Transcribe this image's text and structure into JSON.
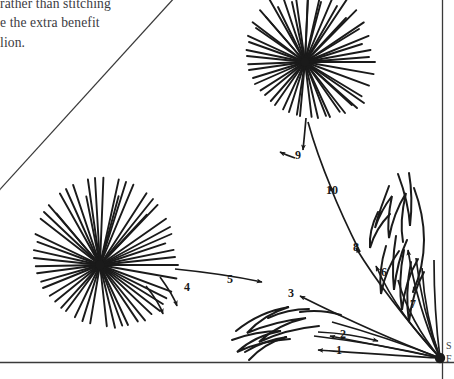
{
  "page": {
    "width": 454,
    "height": 379,
    "background_color": "#ffffff",
    "ink_color": "#1a1a1a",
    "text_color": "#3b3b3f",
    "rule_color": "#3a3a3a"
  },
  "body_text": {
    "line1": "rather than stitching",
    "line2": "e the extra benefit",
    "line3": "lion."
  },
  "edge_text": {
    "top_fragment": "S",
    "bottom_fragment": "F"
  },
  "rules": {
    "bottom_rule": "horizontal page rule",
    "right_rule": "vertical page rule",
    "diagonal_rule": "diagonal crop line"
  },
  "diagram": {
    "launch_point_label": "launch point",
    "stage_labels": [
      "1",
      "2",
      "3",
      "4",
      "5",
      "6",
      "7",
      "8",
      "9",
      "10"
    ],
    "bursts": [
      {
        "name": "lower-left-burst",
        "cx": 100,
        "cy": 265,
        "rays": 36,
        "radius": 78
      },
      {
        "name": "upper-burst",
        "cx": 305,
        "cy": 62,
        "rays": 36,
        "radius": 70
      }
    ],
    "labels": [
      {
        "id": "1",
        "x": 340,
        "y": 350,
        "arrow": "left"
      },
      {
        "id": "2",
        "x": 344,
        "y": 334,
        "arrow": "right"
      },
      {
        "id": "3",
        "x": 292,
        "y": 293,
        "arrow": "left"
      },
      {
        "id": "4",
        "x": 188,
        "y": 287,
        "arrow": "down"
      },
      {
        "id": "5",
        "x": 231,
        "y": 279,
        "arrow": "right"
      },
      {
        "id": "6",
        "x": 385,
        "y": 272,
        "arrow": "up"
      },
      {
        "id": "7",
        "x": 414,
        "y": 304,
        "arrow": "down"
      },
      {
        "id": "8",
        "x": 357,
        "y": 247,
        "arrow": "up"
      },
      {
        "id": "9",
        "x": 299,
        "y": 155,
        "arrow": "left"
      },
      {
        "id": "10",
        "x": 332,
        "y": 190,
        "arrow": "down"
      }
    ]
  }
}
